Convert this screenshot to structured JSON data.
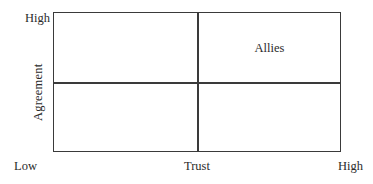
{
  "figure": {
    "type": "two-by-two-matrix",
    "background_color": "#ffffff",
    "line_color": "#3a3a3a",
    "text_color": "#2b2b2b"
  },
  "y_axis": {
    "title": "Agreement",
    "high_label": "High",
    "low_label": ""
  },
  "x_axis": {
    "title": "Trust",
    "low_label": "Low",
    "high_label": "High"
  },
  "quadrants": {
    "top_left": {
      "label": ""
    },
    "top_right": {
      "label": "Allies"
    },
    "bottom_left": {
      "label": ""
    },
    "bottom_right": {
      "label": ""
    }
  },
  "chart_data": {
    "type": "scatter",
    "title": "",
    "xlabel": "Trust",
    "ylabel": "Agreement",
    "xlim": [
      0,
      1
    ],
    "ylim": [
      0,
      1
    ],
    "xtick_labels": [
      "Low",
      "High"
    ],
    "ytick_labels": [
      "High"
    ],
    "grid": false,
    "legend": "none",
    "annotations": [
      {
        "text": "Allies",
        "quadrant": "high-trust / high-agreement",
        "x": 0.75,
        "y": 0.78
      }
    ],
    "dividers": {
      "vertical_x": 0.5,
      "horizontal_y": 0.5
    },
    "series": []
  }
}
